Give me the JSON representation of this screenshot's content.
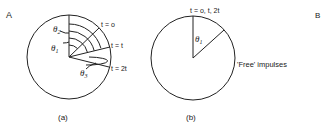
{
  "panel_labels": {
    "left": "A",
    "right": "B"
  },
  "diagram_a": {
    "caption": "(a)",
    "time_labels": [
      "t = o",
      "t = t",
      "t = 2t"
    ],
    "angles": [
      "θ",
      "θ",
      "θ"
    ],
    "angle_subs": [
      "2",
      "1",
      "3"
    ]
  },
  "diagram_b": {
    "caption": "(b)",
    "time_label": "t = o, t, 2t",
    "angle": "θ",
    "angle_sub": "1",
    "annotation": "'Free' impulses"
  }
}
